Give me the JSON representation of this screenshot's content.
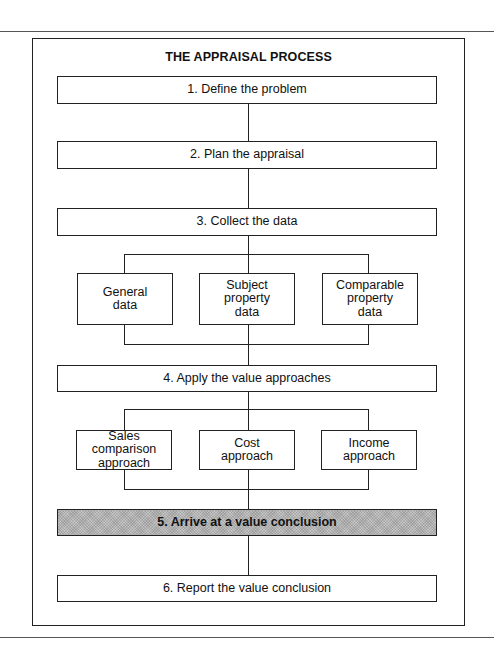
{
  "diagram": {
    "title": "THE APPRAISAL PROCESS",
    "steps": [
      {
        "label": "1. Define the problem"
      },
      {
        "label": "2.  Plan the appraisal"
      },
      {
        "label": "3.  Collect the data"
      },
      {
        "label": "4.  Apply the value approaches"
      },
      {
        "label": "5.  Arrive at a value conclusion",
        "highlighted": true
      },
      {
        "label": "6.  Report the value conclusion"
      }
    ],
    "data_types": [
      {
        "label": "General\ndata"
      },
      {
        "label": "Subject\nproperty\ndata"
      },
      {
        "label": "Comparable\nproperty\ndata"
      }
    ],
    "approaches": [
      {
        "label": "Sales comparison\napproach"
      },
      {
        "label": "Cost\napproach"
      },
      {
        "label": "Income\napproach"
      }
    ],
    "colors": {
      "line": "#222222",
      "highlight_fill": "#c4c4c4",
      "background": "#ffffff"
    }
  }
}
